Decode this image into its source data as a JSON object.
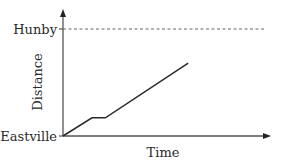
{
  "chart_data": {
    "type": "line",
    "title": "",
    "xlabel": "Time",
    "ylabel": "Distance",
    "x_range": [
      0,
      1
    ],
    "y_range": [
      0,
      1
    ],
    "grid": false,
    "legend": null,
    "y_tick_labels": [
      {
        "value": 0,
        "label": "Eastville"
      },
      {
        "value": 1,
        "label": "Hunby"
      }
    ],
    "reference_lines": [
      {
        "axis": "y",
        "value": 1,
        "style": "dashed",
        "label": "Hunby"
      }
    ],
    "series": [
      {
        "name": "journey",
        "color": "#2a2a2a",
        "points": [
          {
            "x": 0.0,
            "y": 0.0
          },
          {
            "x": 0.14,
            "y": 0.17
          },
          {
            "x": 0.205,
            "y": 0.17
          },
          {
            "x": 0.605,
            "y": 0.68
          }
        ]
      }
    ],
    "axis_color": "#555555"
  }
}
